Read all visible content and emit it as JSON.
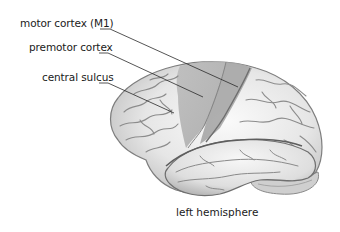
{
  "diagram": {
    "caption": "left hemisphere",
    "labels": [
      {
        "id": "m1",
        "text": "motor cortex (M1)"
      },
      {
        "id": "premotor",
        "text": "premotor cortex"
      },
      {
        "id": "central_sulcus",
        "text": "central sulcus"
      }
    ],
    "colors": {
      "background": "#ffffff",
      "brain_light": "#f2f2f2",
      "brain_mid": "#cfcfcf",
      "brain_shadow": "#9a9a9a",
      "highlight_region": "#b0b0b0",
      "leader_line": "#2a2a2a",
      "text": "#1a1a1a"
    }
  }
}
